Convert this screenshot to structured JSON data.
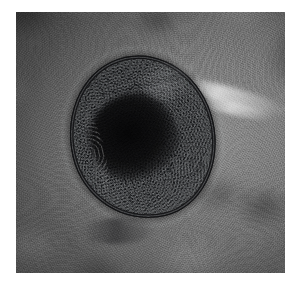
{
  "page": {
    "background_color": "#ffffff",
    "width": 302,
    "height": 294
  },
  "figure": {
    "kind": "photomicrograph",
    "caption": "",
    "plate": {
      "x": 16,
      "y": 12,
      "width": 269,
      "height": 261,
      "border_color": "#ffffff",
      "modality": "brightfield light microscopy",
      "color_mode": "grayscale"
    },
    "background_field": {
      "label": "out-of-focus debris field",
      "mean_tone": "#7a7a7a",
      "dark_tone": "#4a4a4a",
      "light_tone": "#b4b4b4",
      "texture": "mottled granular",
      "highlight_streak": "bright diffraction streak at upper right of specimen"
    },
    "specimen": {
      "label": "parasite cyst",
      "shape": "ovoid",
      "orientation_degrees": -13,
      "center_x_percent": 47,
      "center_y_percent": 48,
      "width_percent": 54,
      "height_percent": 63,
      "wall": {
        "label": "refractile shell wall",
        "color": "#121214",
        "thickness_px": 2,
        "double_contour": true
      },
      "contents": {
        "label": "granular cytoplasm",
        "color": "#101113",
        "texture": "coarse granular",
        "core_label": "dense central mass",
        "core_color": "#030304"
      },
      "features": [
        "thin double-contoured shell wall",
        "dense dark granular interior",
        "knobbed spiculed lower-left margin",
        "bright phase halo along upper-right margin",
        "faint tail-like wisp at lower pole"
      ]
    }
  }
}
